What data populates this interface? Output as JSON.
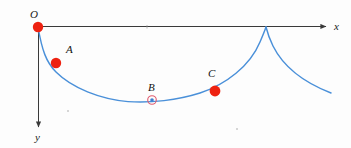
{
  "figure": {
    "type": "math-diagram",
    "background_color": "#fdfdfd"
  },
  "axes": {
    "x_axis": {
      "label": "x",
      "color": "#3a3a3a",
      "origin_px": [
        38,
        27
      ],
      "end_px": [
        327,
        27
      ],
      "arrow": true
    },
    "y_axis": {
      "label": "y",
      "color": "#3a3a3a",
      "origin_px": [
        38,
        27
      ],
      "end_px": [
        38,
        129
      ],
      "arrow": true,
      "direction": "down"
    },
    "origin_label": "O"
  },
  "curve": {
    "name": "cycloid",
    "color": "#4a90d9",
    "stroke_width": 1.4,
    "start_px": [
      38,
      27
    ],
    "cusp_px": [
      266,
      27
    ],
    "lowest_px": [
      152,
      101
    ],
    "tail_end_px": [
      331,
      93
    ]
  },
  "points": [
    {
      "label": "O",
      "x": 38,
      "y": 27,
      "style": "filled",
      "fill": "#ee2211",
      "radius": 5.2,
      "label_dx": -8,
      "label_dy": -18
    },
    {
      "label": "A",
      "x": 56,
      "y": 63,
      "style": "filled",
      "fill": "#ee2211",
      "radius": 5.2,
      "label_dx": 10,
      "label_dy": -19
    },
    {
      "label": "B",
      "x": 152,
      "y": 100,
      "style": "ring",
      "ring_color": "#e05a6e",
      "fill": "#3f7fd0",
      "radius": 4.2,
      "label_dx": -4,
      "label_dy": -18
    },
    {
      "label": "C",
      "x": 215,
      "y": 91,
      "style": "filled",
      "fill": "#ee2211",
      "radius": 5.4,
      "label_dx": -7,
      "label_dy": -23
    }
  ],
  "specks": [
    {
      "x": 236,
      "y": 128
    },
    {
      "x": 67,
      "y": 110
    }
  ]
}
